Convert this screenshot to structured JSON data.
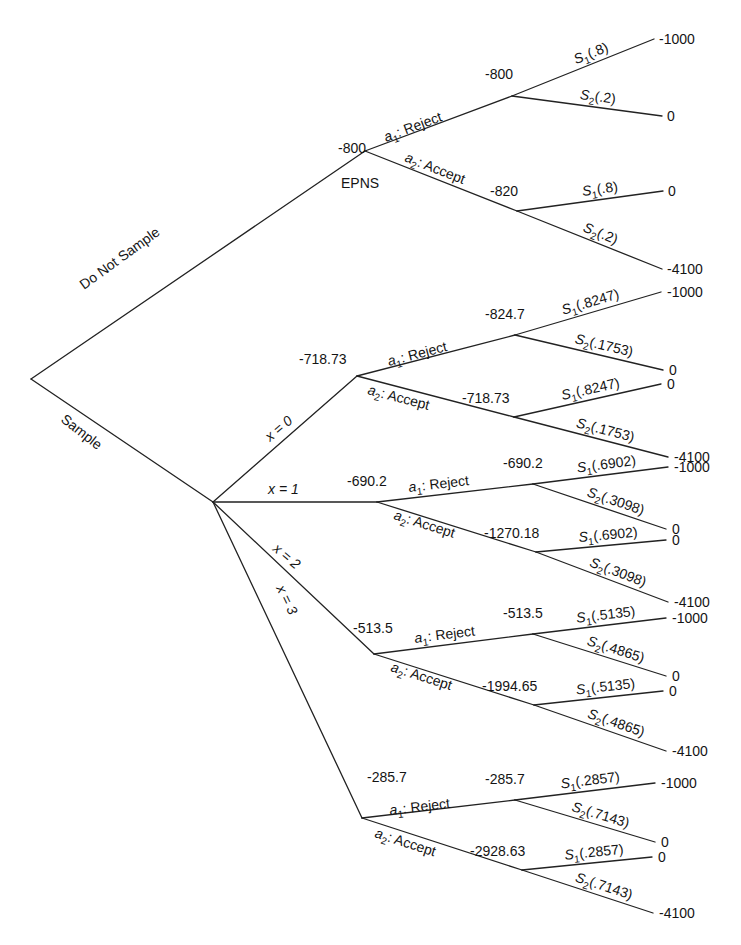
{
  "diagram": {
    "type": "decision-tree",
    "root": {
      "x": 31,
      "y": 379
    },
    "top_branches": [
      {
        "label": "Do Not Sample",
        "to": "epns"
      },
      {
        "label": "Sample",
        "to": "sample"
      }
    ],
    "epns": {
      "node": {
        "x": 365,
        "y": 151
      },
      "value": "-800",
      "name": "EPNS",
      "actions": [
        {
          "action_symbol": "a",
          "action_sub": "1",
          "action_name": ": Reject",
          "chance_node": {
            "x": 512,
            "y": 96
          },
          "value": "-800",
          "outcomes": [
            {
              "state": "S",
              "sub": "1",
              "prob": "(.8)",
              "end": {
                "x": 654,
                "y": 39
              },
              "payoff": "-1000"
            },
            {
              "state": "S",
              "sub": "2",
              "prob": "(.2)",
              "end": {
                "x": 662,
                "y": 116
              },
              "payoff": "0"
            }
          ]
        },
        {
          "action_symbol": "a",
          "action_sub": "2",
          "action_name": ": Accept",
          "chance_node": {
            "x": 517,
            "y": 211
          },
          "value": "-820",
          "outcomes": [
            {
              "state": "S",
              "sub": "1",
              "prob": "(.8)",
              "end": {
                "x": 663,
                "y": 191
              },
              "payoff": "0"
            },
            {
              "state": "S",
              "sub": "2",
              "prob": "(.2)",
              "end": {
                "x": 662,
                "y": 269
              },
              "payoff": "-4100"
            }
          ]
        }
      ]
    },
    "sample": {
      "node": {
        "x": 213,
        "y": 502
      },
      "branches": [
        {
          "label": "x = 0",
          "decision_node": {
            "x": 357,
            "y": 376
          },
          "value": "-718.73",
          "actions": [
            {
              "action_sub": "1",
              "action_name": ": Reject",
              "chance_node": {
                "x": 515,
                "y": 335
              },
              "value": "-824.7",
              "outcomes": [
                {
                  "sub": "1",
                  "prob": "(.8247)",
                  "end": {
                    "x": 661,
                    "y": 292
                  },
                  "payoff": "-1000"
                },
                {
                  "sub": "2",
                  "prob": "(.1753)",
                  "end": {
                    "x": 663,
                    "y": 370
                  },
                  "payoff": "0"
                }
              ]
            },
            {
              "action_sub": "2",
              "action_name": ": Accept",
              "chance_node": {
                "x": 514,
                "y": 417
              },
              "value": "-718.73",
              "outcomes": [
                {
                  "sub": "1",
                  "prob": "(.8247)",
                  "end": {
                    "x": 661,
                    "y": 384
                  },
                  "payoff": "0"
                },
                {
                  "sub": "2",
                  "prob": "(.1753)",
                  "end": {
                    "x": 668,
                    "y": 457
                  },
                  "payoff": "-4100"
                }
              ]
            }
          ]
        },
        {
          "label": "x = 1",
          "decision_node": {
            "x": 377,
            "y": 502
          },
          "value": "-690.2",
          "actions": [
            {
              "action_sub": "1",
              "action_name": ": Reject",
              "chance_node": {
                "x": 533,
                "y": 484
              },
              "value": "-690.2",
              "outcomes": [
                {
                  "sub": "1",
                  "prob": "(.6902)",
                  "end": {
                    "x": 668,
                    "y": 467
                  },
                  "payoff": "-1000"
                },
                {
                  "sub": "2",
                  "prob": "(.3098)",
                  "end": {
                    "x": 666,
                    "y": 529
                  },
                  "payoff": "0"
                }
              ]
            },
            {
              "action_sub": "2",
              "action_name": ": Accept",
              "chance_node": {
                "x": 536,
                "y": 552
              },
              "value": "-1270.18",
              "outcomes": [
                {
                  "sub": "1",
                  "prob": "(.6902)",
                  "end": {
                    "x": 666,
                    "y": 540
                  },
                  "payoff": "0"
                },
                {
                  "sub": "2",
                  "prob": "(.3098)",
                  "end": {
                    "x": 668,
                    "y": 602
                  },
                  "payoff": "-4100"
                }
              ]
            }
          ]
        },
        {
          "label": "x = 2",
          "decision_node": {
            "x": 374,
            "y": 654
          },
          "value": "-513.5",
          "actions": [
            {
              "action_sub": "1",
              "action_name": ": Reject",
              "chance_node": {
                "x": 533,
                "y": 634
              },
              "value": "-513.5",
              "outcomes": [
                {
                  "sub": "1",
                  "prob": "(.5135)",
                  "end": {
                    "x": 666,
                    "y": 618
                  },
                  "payoff": "-1000"
                },
                {
                  "sub": "2",
                  "prob": "(.4865)",
                  "end": {
                    "x": 666,
                    "y": 676
                  },
                  "payoff": "0"
                }
              ]
            },
            {
              "action_sub": "2",
              "action_name": ": Accept",
              "chance_node": {
                "x": 534,
                "y": 705
              },
              "value": "-1994.65",
              "outcomes": [
                {
                  "sub": "1",
                  "prob": "(.5135)",
                  "end": {
                    "x": 663,
                    "y": 691
                  },
                  "payoff": "0"
                },
                {
                  "sub": "2",
                  "prob": "(.4865)",
                  "end": {
                    "x": 666,
                    "y": 751
                  },
                  "payoff": "-4100"
                }
              ]
            }
          ]
        },
        {
          "label": "x = 3",
          "decision_node": {
            "x": 362,
            "y": 818
          },
          "value": "-285.7",
          "actions": [
            {
              "action_sub": "1",
              "action_name": ": Reject",
              "chance_node": {
                "x": 515,
                "y": 800
              },
              "value": "-285.7",
              "outcomes": [
                {
                  "sub": "1",
                  "prob": "(.2857)",
                  "end": {
                    "x": 655,
                    "y": 783
                  },
                  "payoff": "-1000"
                },
                {
                  "sub": "2",
                  "prob": "(.7143)",
                  "end": {
                    "x": 655,
                    "y": 842
                  },
                  "payoff": "0"
                }
              ]
            },
            {
              "action_sub": "2",
              "action_name": ": Accept",
              "chance_node": {
                "x": 522,
                "y": 870
              },
              "value": "-2928.63",
              "outcomes": [
                {
                  "sub": "1",
                  "prob": "(.2857)",
                  "end": {
                    "x": 652,
                    "y": 857
                  },
                  "payoff": "0"
                },
                {
                  "sub": "2",
                  "prob": "(.7143)",
                  "end": {
                    "x": 653,
                    "y": 913
                  },
                  "payoff": "-4100"
                }
              ]
            }
          ]
        }
      ]
    }
  }
}
